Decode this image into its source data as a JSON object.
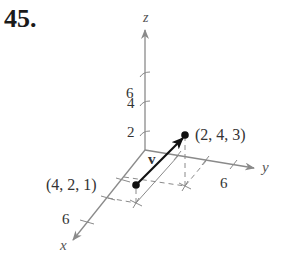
{
  "problem_number": "45.",
  "diagram": {
    "type": "3d-vector-plot",
    "axes": {
      "x": {
        "label": "x",
        "tick_labels": [
          "6"
        ]
      },
      "y": {
        "label": "y",
        "tick_labels": [
          "6"
        ]
      },
      "z": {
        "label": "z",
        "tick_labels": [
          "2",
          "4",
          "6"
        ]
      }
    },
    "vector": {
      "label": "v",
      "initial_point": {
        "coords": [
          4,
          2,
          1
        ],
        "label": "(4, 2, 1)"
      },
      "terminal_point": {
        "coords": [
          2,
          4,
          3
        ],
        "label": "(2, 4, 3)"
      }
    },
    "colors": {
      "axis": "#8a8a8a",
      "vector": "#111111",
      "dashed": "#8a8a8a",
      "text": "#333333"
    }
  }
}
